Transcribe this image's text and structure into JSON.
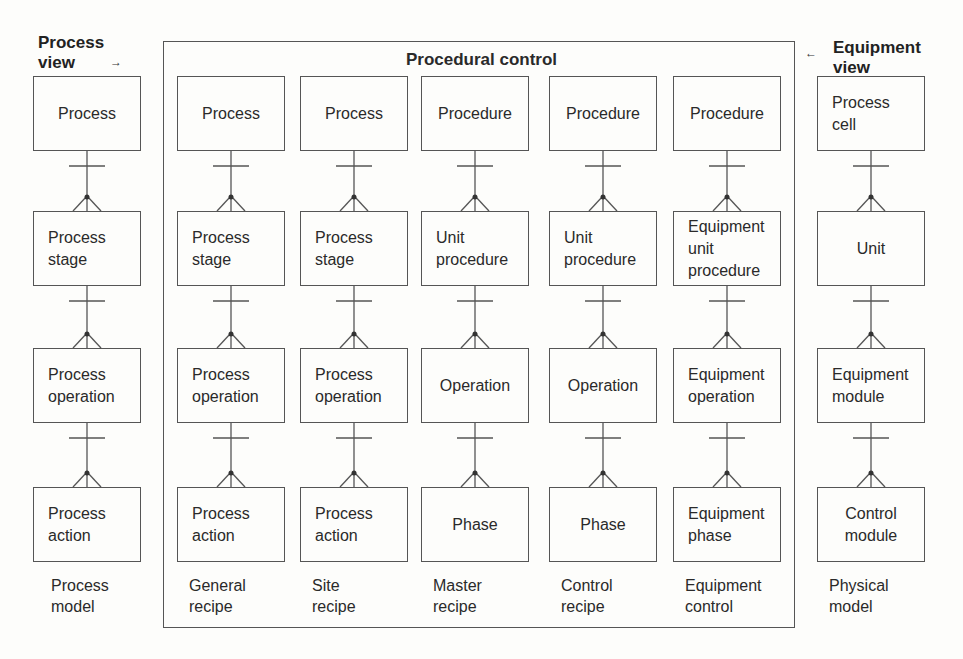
{
  "views": {
    "process_view": {
      "line1": "Process",
      "line2": "view",
      "arrow": "→"
    },
    "equipment_view": {
      "line1": "Equipment",
      "line2": "view",
      "arrow": "←"
    }
  },
  "frame": {
    "title": "Procedural control"
  },
  "columns": [
    {
      "id": "process-model",
      "caption": [
        "Process",
        "model"
      ],
      "boxes": [
        [
          "Process"
        ],
        [
          "Process",
          "stage"
        ],
        [
          "Process",
          "operation"
        ],
        [
          "Process",
          "action"
        ]
      ]
    },
    {
      "id": "general-recipe",
      "caption": [
        "General",
        "recipe"
      ],
      "boxes": [
        [
          "Process"
        ],
        [
          "Process",
          "stage"
        ],
        [
          "Process",
          "operation"
        ],
        [
          "Process",
          "action"
        ]
      ]
    },
    {
      "id": "site-recipe",
      "caption": [
        "Site",
        "recipe"
      ],
      "boxes": [
        [
          "Process"
        ],
        [
          "Process",
          "stage"
        ],
        [
          "Process",
          "operation"
        ],
        [
          "Process",
          "action"
        ]
      ]
    },
    {
      "id": "master-recipe",
      "caption": [
        "Master",
        "recipe"
      ],
      "boxes": [
        [
          "Procedure"
        ],
        [
          "Unit",
          "procedure"
        ],
        [
          "Operation"
        ],
        [
          "Phase"
        ]
      ]
    },
    {
      "id": "control-recipe",
      "caption": [
        "Control",
        "recipe"
      ],
      "boxes": [
        [
          "Procedure"
        ],
        [
          "Unit",
          "procedure"
        ],
        [
          "Operation"
        ],
        [
          "Phase"
        ]
      ]
    },
    {
      "id": "equipment-control",
      "caption": [
        "Equipment",
        "control"
      ],
      "boxes": [
        [
          "Procedure"
        ],
        [
          "Equipment",
          "unit",
          "procedure"
        ],
        [
          "Equipment",
          "operation"
        ],
        [
          "Equipment",
          "phase"
        ]
      ]
    },
    {
      "id": "physical-model",
      "caption": [
        "Physical",
        "model"
      ],
      "boxes": [
        [
          "Process",
          "cell"
        ],
        [
          "Unit"
        ],
        [
          "Equipment",
          "module"
        ],
        [
          "Control",
          "module"
        ]
      ]
    }
  ],
  "relationship": {
    "type": "one-to-many",
    "notation": "crow's foot"
  },
  "colors": {
    "line": "#555555",
    "text": "#2a2a2a",
    "background": "#fdfdfb"
  }
}
